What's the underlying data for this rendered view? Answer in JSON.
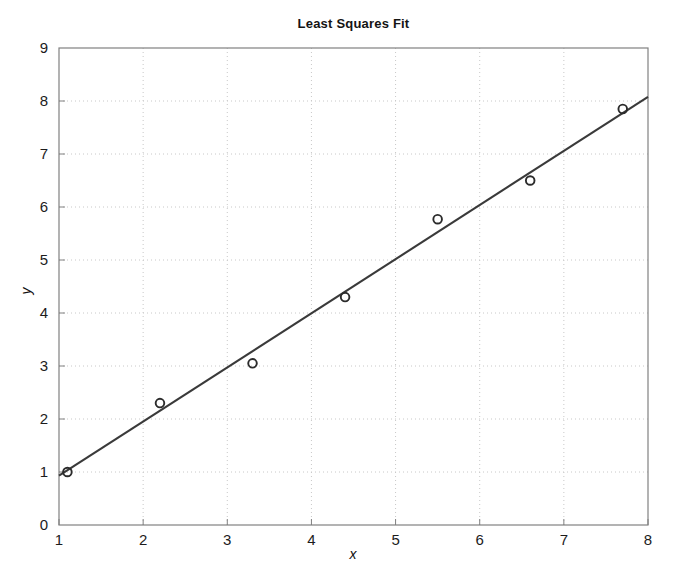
{
  "chart_data": {
    "type": "scatter",
    "title": "Least Squares Fit",
    "xlabel": "x",
    "ylabel": "y",
    "xlim": [
      1,
      8
    ],
    "ylim": [
      0,
      9
    ],
    "xticks": [
      1,
      2,
      3,
      4,
      5,
      6,
      7,
      8
    ],
    "yticks": [
      0,
      1,
      2,
      3,
      4,
      5,
      6,
      7,
      8,
      9
    ],
    "grid": true,
    "legend": null,
    "series": [
      {
        "name": "data points",
        "marker": "open-circle",
        "color": "#2b2b2b",
        "x": [
          1.1,
          2.2,
          3.3,
          4.4,
          5.5,
          6.6,
          7.7
        ],
        "y": [
          1.0,
          2.3,
          3.05,
          4.3,
          5.77,
          6.5,
          7.85
        ]
      },
      {
        "name": "least squares fit line",
        "marker": "none",
        "color": "#3a3a3a",
        "x": [
          1.0,
          8.0
        ],
        "y": [
          0.93,
          8.08
        ]
      }
    ]
  },
  "axes": {
    "x_tick_labels": [
      "1",
      "2",
      "3",
      "4",
      "5",
      "6",
      "7",
      "8"
    ],
    "y_tick_labels": [
      "0",
      "1",
      "2",
      "3",
      "4",
      "5",
      "6",
      "7",
      "8",
      "9"
    ],
    "x_axis_label": "x",
    "y_axis_label": "y"
  },
  "style": {
    "background": "#ffffff",
    "axis_color": "#808080",
    "grid_color": "#c8c8c8",
    "marker_color": "#2b2b2b",
    "line_color": "#3a3a3a",
    "title_color": "#141414"
  }
}
